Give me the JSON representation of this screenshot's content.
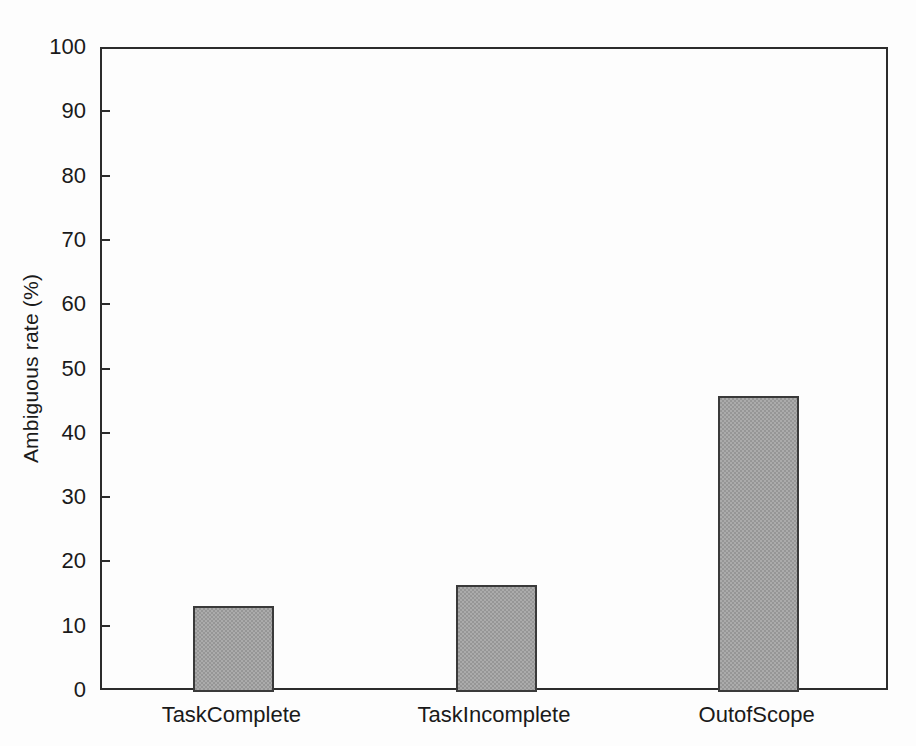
{
  "chart_data": {
    "type": "bar",
    "title": "",
    "subtitle": "",
    "xlabel": "",
    "ylabel": "Ambiguous rate (%)",
    "categories": [
      "TaskComplete",
      "TaskIncomplete",
      "OutofScope"
    ],
    "values": [
      13.3,
      16.7,
      46.0
    ],
    "ylim": [
      0,
      100
    ],
    "yticks": [
      0,
      10,
      20,
      30,
      40,
      50,
      60,
      70,
      80,
      90,
      100
    ],
    "ytick_labels": [
      "0",
      "10",
      "20",
      "30",
      "40",
      "50",
      "60",
      "70",
      "80",
      "90",
      "100"
    ],
    "grid": false,
    "legend": null,
    "legend_position": "none",
    "annotations": [],
    "series": [
      {
        "name": "Ambiguous rate",
        "values": [
          13.3,
          16.7,
          46.0
        ]
      }
    ],
    "colors": {
      "bar_fill": "#969696",
      "bar_border": "#3a3a3a",
      "axis": "#2c2c2c",
      "text": "#1a1a1a",
      "background": "#fdfdfd"
    }
  }
}
